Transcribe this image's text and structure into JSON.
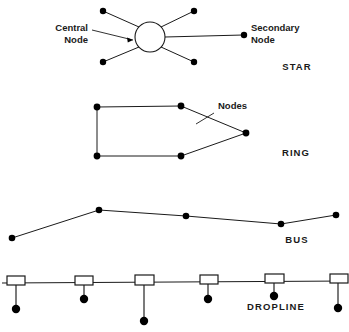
{
  "figure": {
    "background_color": "#ffffff",
    "line_color": "#1a1a1a",
    "node_color": "#000000"
  },
  "topologies": [
    {
      "name": "STAR",
      "name_label": "STAR",
      "name_pos": {
        "x": 297,
        "y": 70
      },
      "annotations": [
        {
          "id": "central-node",
          "line1": "Central",
          "line2": "Node",
          "anchor": "end",
          "x": 88,
          "y": 31,
          "line_height": 12
        },
        {
          "id": "secondary-node",
          "line1": "Secondary",
          "line2": "Node",
          "anchor": "start",
          "x": 251,
          "y": 31,
          "line_height": 12
        }
      ],
      "hub": {
        "cx": 150,
        "cy": 37,
        "r": 15
      },
      "spokes": [
        {
          "x1": 103,
          "y1": 11,
          "x2": 139,
          "y2": 27,
          "dot": {
            "cx": 103,
            "cy": 11,
            "r": 3.2
          }
        },
        {
          "x1": 194,
          "y1": 11,
          "x2": 161,
          "y2": 27,
          "dot": {
            "cx": 194,
            "cy": 11,
            "r": 3.2
          }
        },
        {
          "x1": 103,
          "y1": 62,
          "x2": 139,
          "y2": 47,
          "dot": {
            "cx": 103,
            "cy": 62,
            "r": 3.2
          }
        },
        {
          "x1": 194,
          "y1": 62,
          "x2": 161,
          "y2": 47,
          "dot": {
            "cx": 194,
            "cy": 62,
            "r": 3.2
          }
        },
        {
          "x1": 165,
          "y1": 37,
          "x2": 243,
          "y2": 35,
          "dot": {
            "cx": 244,
            "cy": 35,
            "r": 3.2
          }
        }
      ],
      "leader": {
        "path": "M 92 30 L 133 40",
        "arrow": "M 133 40 L 127 37.6 L 127.8 42.4 Z"
      }
    },
    {
      "name": "RING",
      "name_label": "RING",
      "name_pos": {
        "x": 296,
        "y": 156
      },
      "annotations": [
        {
          "id": "nodes",
          "line1": "Nodes",
          "line2": "",
          "anchor": "start",
          "x": 218,
          "y": 109,
          "line_height": 12
        }
      ],
      "ring_nodes": [
        {
          "cx": 97,
          "cy": 107,
          "r": 3.4
        },
        {
          "cx": 181,
          "cy": 106,
          "r": 3.4
        },
        {
          "cx": 246,
          "cy": 133,
          "r": 3.4
        },
        {
          "cx": 181,
          "cy": 156,
          "r": 3.4
        },
        {
          "cx": 97,
          "cy": 156,
          "r": 3.4
        }
      ],
      "ring_path": "M 97 107 L 181 106 L 246 133 L 181 156 L 97 156 Z",
      "leader": {
        "path": "M 214 113 L 196 124"
      }
    },
    {
      "name": "BUS",
      "name_label": "BUS",
      "name_pos": {
        "x": 297,
        "y": 243
      },
      "annotations": [],
      "bus_nodes": [
        {
          "cx": 12,
          "cy": 238,
          "r": 3.3
        },
        {
          "cx": 99,
          "cy": 210,
          "r": 3.3
        },
        {
          "cx": 186,
          "cy": 216,
          "r": 3.3
        },
        {
          "cx": 281,
          "cy": 224,
          "r": 3.3
        },
        {
          "cx": 336,
          "cy": 215,
          "r": 3.3
        }
      ],
      "bus_path": "M 12 238 L 99 210 L 186 216 L 281 224 L 336 215"
    },
    {
      "name": "DROPLINE",
      "name_label": "DROPLINE",
      "name_pos": {
        "x": 276,
        "y": 310
      },
      "annotations": [],
      "trunk_path": "M 2 283 L 347 281",
      "taps": [
        {
          "box_x": 7,
          "box_y": 276,
          "box_w": 18,
          "box_h": 9,
          "drop_x": 16,
          "drop_y1": 285,
          "drop_y2": 306,
          "dot": {
            "cx": 16,
            "cy": 309,
            "r": 4.2
          }
        },
        {
          "box_x": 75,
          "box_y": 276,
          "box_w": 18,
          "box_h": 9,
          "drop_x": 84,
          "drop_y1": 285,
          "drop_y2": 296,
          "dot": {
            "cx": 84,
            "cy": 299,
            "r": 4.2
          }
        },
        {
          "box_x": 135,
          "box_y": 275,
          "box_w": 19,
          "box_h": 10,
          "drop_x": 144,
          "drop_y1": 285,
          "drop_y2": 318,
          "dot": {
            "cx": 144,
            "cy": 321,
            "r": 4.2
          }
        },
        {
          "box_x": 200,
          "box_y": 275,
          "box_w": 18,
          "box_h": 9,
          "drop_x": 208,
          "drop_y1": 284,
          "drop_y2": 296,
          "dot": {
            "cx": 208,
            "cy": 299,
            "r": 4.2
          }
        },
        {
          "box_x": 265,
          "box_y": 274,
          "box_w": 19,
          "box_h": 9,
          "drop_x": 274,
          "drop_y1": 283,
          "drop_y2": 293,
          "dot": {
            "cx": 274,
            "cy": 296,
            "r": 4.2
          }
        },
        {
          "box_x": 330,
          "box_y": 274,
          "box_w": 18,
          "box_h": 9,
          "drop_x": 338,
          "drop_y1": 283,
          "drop_y2": 305,
          "dot": {
            "cx": 338,
            "cy": 308,
            "r": 4.2
          }
        }
      ]
    }
  ]
}
